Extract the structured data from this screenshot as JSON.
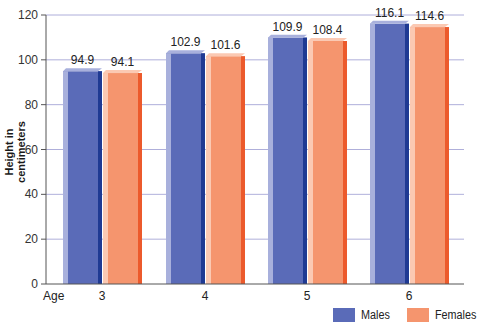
{
  "chart_data": {
    "type": "bar",
    "title": "",
    "xlabel": "Age",
    "ylabel": "Height in centimeters",
    "ylim": [
      0,
      120
    ],
    "yticks": [
      0,
      20,
      40,
      60,
      80,
      100,
      120
    ],
    "grid": true,
    "legend_position": "bottom-right",
    "categories": [
      "3",
      "4",
      "5",
      "6"
    ],
    "series": [
      {
        "name": "Males",
        "color": "#5a6bb8",
        "values": [
          94.9,
          102.9,
          109.9,
          116.1
        ]
      },
      {
        "name": "Females",
        "color": "#f5956e",
        "values": [
          94.1,
          101.6,
          108.4,
          114.6
        ]
      }
    ]
  },
  "axis": {
    "x_title": "Age",
    "y_title": "Height in centimeters"
  },
  "legend": {
    "males": "Males",
    "females": "Females"
  },
  "colors": {
    "male_face": "#5a6bb8",
    "male_light": "#a8b0dc",
    "male_dark": "#1f3a93",
    "female_face": "#f5956e",
    "female_light": "#fbc9b3",
    "female_dark": "#ec5a2c",
    "axis": "#555555",
    "grid": "#9a9ad0"
  }
}
